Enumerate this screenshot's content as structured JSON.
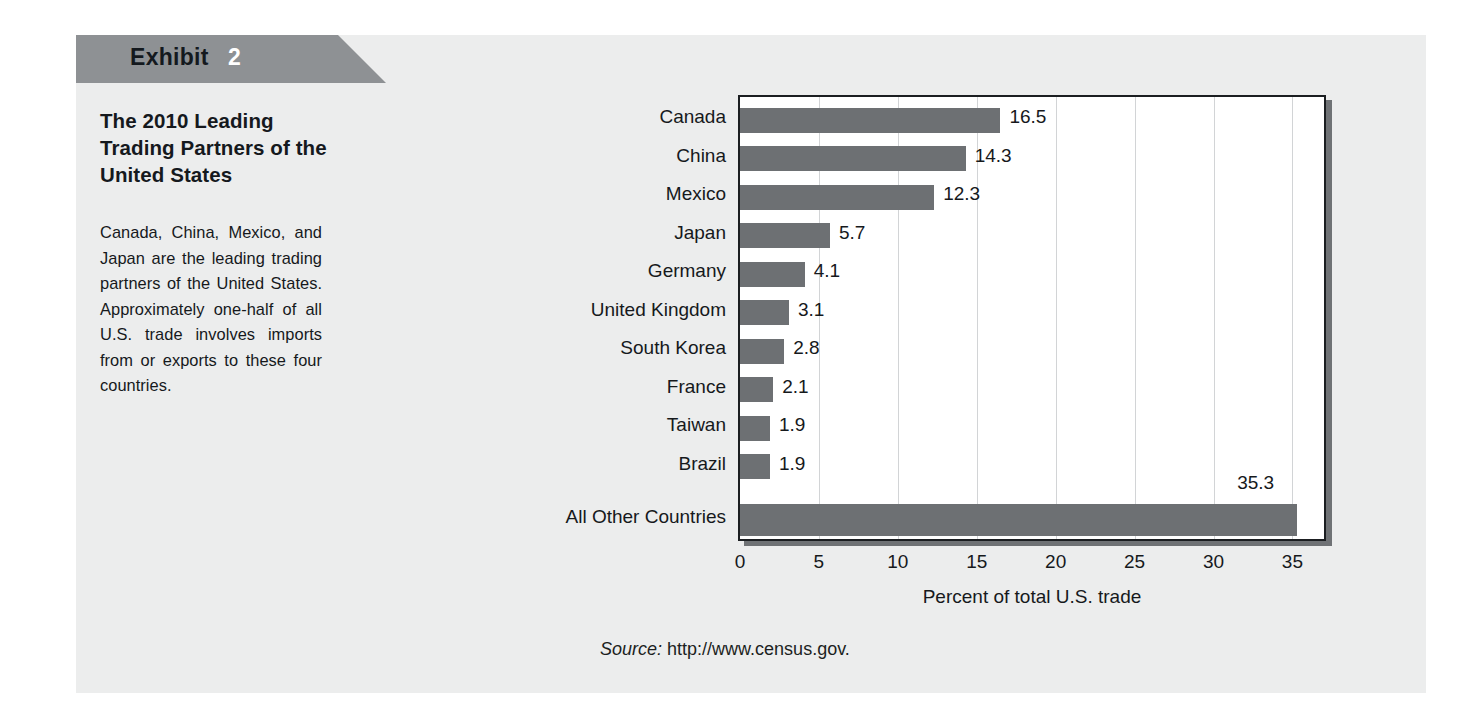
{
  "exhibit": {
    "tab_label": "Exhibit",
    "tab_number": "2",
    "title": "The 2010 Leading Trading Partners of the United States",
    "body": "Canada, China, Mexico, and Japan are the leading trading partners of the United States. Approximately one-half of all U.S. trade involves imports from or exports to these four countries.",
    "source_word": "Source:",
    "source_url": "http://www.census.gov."
  },
  "colors": {
    "panel_background": "#eceded",
    "tab_fill": "#8e9194",
    "bar_fill": "#6d7073",
    "plot_border": "#1b1e21",
    "gridline": "#d2d4d6",
    "text": "#16191c",
    "page_background": "#ffffff"
  },
  "chart_data": {
    "type": "bar",
    "orientation": "horizontal",
    "title": "The 2010 Leading Trading Partners of the United States",
    "xlabel": "Percent of total U.S. trade",
    "ylabel": "",
    "xlim": [
      0,
      37
    ],
    "xticks": [
      0,
      5,
      10,
      15,
      20,
      25,
      30,
      35
    ],
    "xtick_labels": [
      "0",
      "5",
      "10",
      "15",
      "20",
      "25",
      "30",
      "35"
    ],
    "grid": "vertical",
    "legend": "none",
    "categories": [
      "Canada",
      "China",
      "Mexico",
      "Japan",
      "Germany",
      "United Kingdom",
      "South Korea",
      "France",
      "Taiwan",
      "Brazil",
      "All Other Countries"
    ],
    "values": [
      16.5,
      14.3,
      12.3,
      5.7,
      4.1,
      3.1,
      2.8,
      2.1,
      1.9,
      1.9,
      35.3
    ],
    "value_labels": [
      "16.5",
      "14.3",
      "12.3",
      "5.7",
      "4.1",
      "3.1",
      "2.8",
      "2.1",
      "1.9",
      "1.9",
      "35.3"
    ]
  }
}
